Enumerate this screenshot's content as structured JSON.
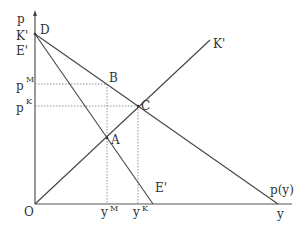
{
  "diagram": {
    "axes": {
      "y_axis_label": "p",
      "x_axis_label": "y",
      "origin_label": "O"
    },
    "left_labels": {
      "k_prime": "K'",
      "e_prime": "E'",
      "p_m_base": "p",
      "p_m_sup": "M",
      "p_k_base": "p",
      "p_k_sup": "K"
    },
    "bottom_labels": {
      "y_m_base": "y",
      "y_m_sup": "M",
      "y_k_base": "y",
      "y_k_sup": "K"
    },
    "points": {
      "D": "D",
      "B": "B",
      "C": "C",
      "A": "A"
    },
    "curve_labels": {
      "k_prime_line": "K'",
      "e_prime_line": "E'",
      "demand_line": "p(y)"
    },
    "colors": {
      "line": "#444444",
      "axis": "#555555",
      "dashed": "#888888",
      "text": "#333333"
    }
  }
}
